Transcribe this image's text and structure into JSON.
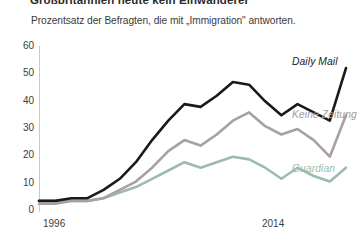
{
  "header": {
    "title": "Großbritannien heute kein Einwanderer",
    "subtitle": "Prozentsatz der Befragten, die mit „Immigration\" antworten."
  },
  "chart_data": {
    "type": "line",
    "title": "Großbritannien heute kein Einwanderer",
    "subtitle": "Prozentsatz der Befragten, die mit „Immigration\" antworten.",
    "xlabel": "",
    "ylabel": "",
    "xlim": [
      1996,
      2015
    ],
    "ylim": [
      0,
      60
    ],
    "yticks": [
      0,
      10,
      20,
      30,
      40,
      50,
      60
    ],
    "xticks": [
      1996,
      2014
    ],
    "xtick_labels": [
      "1996",
      "2014"
    ],
    "grid": false,
    "legend_position": "inline-right",
    "x": [
      1996,
      1997,
      1998,
      1999,
      2000,
      2001,
      2002,
      2003,
      2004,
      2005,
      2006,
      2007,
      2008,
      2009,
      2010,
      2011,
      2012,
      2013,
      2014,
      2015
    ],
    "series": [
      {
        "name": "Daily Mail",
        "color": "#1a1a1a",
        "values": [
          4,
          4,
          5,
          5,
          8,
          12,
          18,
          26,
          33,
          39,
          38,
          42,
          47,
          46,
          40,
          35,
          39,
          36,
          33,
          52
        ]
      },
      {
        "name": "Keine Zeitung",
        "color": "#a9a0a3",
        "values": [
          3,
          3,
          4,
          4,
          5,
          8,
          11,
          16,
          22,
          26,
          24,
          28,
          33,
          36,
          31,
          28,
          30,
          26,
          20,
          35
        ]
      },
      {
        "name": "Guardian",
        "color": "#9cbcae",
        "values": [
          4,
          4,
          4,
          4,
          5,
          7,
          9,
          12,
          15,
          18,
          16,
          18,
          20,
          19,
          16,
          12,
          16,
          13,
          11,
          16
        ]
      }
    ]
  },
  "axes": {
    "y_ticks": [
      "60",
      "50",
      "40",
      "30",
      "20",
      "10",
      "0"
    ],
    "x_ticks": [
      "1996",
      "2014"
    ]
  },
  "legend": {
    "daily_mail": "Daily Mail",
    "keine_zeitung": "Keine Zeitung",
    "guardian": "Guardian"
  }
}
